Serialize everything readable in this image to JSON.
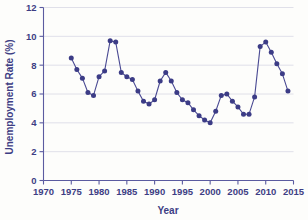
{
  "chart_data": {
    "type": "line",
    "title": "",
    "xlabel": "Year",
    "ylabel": "Unemployment Rate (%)",
    "xlim": [
      1970,
      2015
    ],
    "ylim": [
      0,
      12
    ],
    "xticks": [
      1970,
      1975,
      1980,
      1985,
      1990,
      1995,
      2000,
      2005,
      2010,
      2015
    ],
    "yticks": [
      0,
      2,
      4,
      6,
      8,
      10,
      12
    ],
    "grid": "horizontal",
    "legend": "none",
    "marker": "filled-circle",
    "series_color": "#3c3c86",
    "line_color": "#4a4a93",
    "x": [
      1975,
      1976,
      1977,
      1978,
      1979,
      1980,
      1981,
      1982,
      1983,
      1984,
      1985,
      1986,
      1987,
      1988,
      1989,
      1990,
      1991,
      1992,
      1993,
      1994,
      1995,
      1996,
      1997,
      1998,
      1999,
      2000,
      2001,
      2002,
      2003,
      2004,
      2005,
      2006,
      2007,
      2008,
      2009,
      2010,
      2011,
      2012,
      2013,
      2014
    ],
    "values": [
      8.5,
      7.7,
      7.1,
      6.1,
      5.9,
      7.2,
      7.6,
      9.7,
      9.6,
      7.5,
      7.2,
      7.0,
      6.2,
      5.5,
      5.3,
      5.6,
      6.9,
      7.5,
      6.9,
      6.1,
      5.6,
      5.4,
      4.9,
      4.5,
      4.2,
      4.0,
      4.8,
      5.9,
      6.0,
      5.5,
      5.1,
      4.6,
      4.6,
      5.8,
      9.3,
      9.6,
      8.9,
      8.1,
      7.4,
      6.2
    ]
  },
  "axes": {
    "ylabel_text": "Unemployment Rate (%)",
    "xlabel_text": "Year",
    "ytick_labels": [
      "0",
      "2",
      "4",
      "6",
      "8",
      "10",
      "12"
    ],
    "xtick_labels": [
      "1970",
      "1975",
      "1980",
      "1985",
      "1990",
      "1995",
      "2000",
      "2005",
      "2010",
      "2015"
    ]
  }
}
